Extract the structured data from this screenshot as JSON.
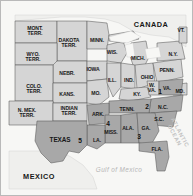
{
  "map": {
    "title": "United States Civil War Era Map",
    "colors": {
      "union": "#d5d5d5",
      "confederate": "#a8a8a8",
      "territory": "#d5d5d5",
      "water": "#f4f4f2",
      "foreign": "#efefed",
      "border": "#5a5a5a",
      "frame": "#b9b9b9",
      "label": "#171717",
      "ocean_label": "#b6b6b6"
    },
    "regions": [
      {
        "id": "mont-terr",
        "label": "MONT.\nTERR.",
        "x": 34,
        "y": 30,
        "size": "s6",
        "fill": "union"
      },
      {
        "id": "dakota-terr",
        "label": "DAKOTA\nTERR.",
        "x": 68,
        "y": 42,
        "size": "s6",
        "fill": "union"
      },
      {
        "id": "minn",
        "label": "MINN.",
        "x": 96,
        "y": 39,
        "size": "s6",
        "fill": "union"
      },
      {
        "id": "wyo-terr",
        "label": "WYO.\nTERR.",
        "x": 32,
        "y": 56,
        "size": "s6",
        "fill": "union"
      },
      {
        "id": "wis",
        "label": "WIS.",
        "x": 111,
        "y": 51,
        "size": "s6",
        "fill": "union"
      },
      {
        "id": "mich",
        "label": "MICH.",
        "x": 137,
        "y": 57,
        "size": "s6",
        "fill": "union"
      },
      {
        "id": "colo-terr",
        "label": "COLO.\nTERR.",
        "x": 33,
        "y": 88,
        "size": "s6",
        "fill": "union"
      },
      {
        "id": "nebr",
        "label": "NEBR.",
        "x": 66,
        "y": 72,
        "size": "s6",
        "fill": "union"
      },
      {
        "id": "iowa",
        "label": "IOWA",
        "x": 92,
        "y": 68,
        "size": "s6",
        "fill": "union"
      },
      {
        "id": "ill",
        "label": "ILL.",
        "x": 111,
        "y": 79,
        "size": "s6",
        "fill": "union"
      },
      {
        "id": "ind",
        "label": "IND.",
        "x": 128,
        "y": 79,
        "size": "s6",
        "fill": "union"
      },
      {
        "id": "ohio",
        "label": "OHIO",
        "x": 146,
        "y": 76,
        "size": "s6",
        "fill": "union"
      },
      {
        "id": "penn",
        "label": "PENN.",
        "x": 166,
        "y": 69,
        "size": "s6",
        "fill": "union"
      },
      {
        "id": "ny",
        "label": "N.Y.",
        "x": 172,
        "y": 53,
        "size": "s6",
        "fill": "union"
      },
      {
        "id": "vt",
        "label": "VT.",
        "x": 180,
        "y": 29,
        "size": "s6",
        "fill": "union"
      },
      {
        "id": "kans",
        "label": "KANS.",
        "x": 66,
        "y": 93,
        "size": "s6",
        "fill": "union"
      },
      {
        "id": "mo",
        "label": "MO.",
        "x": 95,
        "y": 92,
        "size": "s6",
        "fill": "union"
      },
      {
        "id": "ky",
        "label": "KY.",
        "x": 136,
        "y": 93,
        "size": "s6",
        "fill": "union"
      },
      {
        "id": "w-va",
        "label": "W.\nVA.",
        "x": 151,
        "y": 87,
        "size": "s6",
        "fill": "union"
      },
      {
        "id": "va",
        "label": "VA.",
        "x": 166,
        "y": 87,
        "size": "s6",
        "fill": "confederate"
      },
      {
        "id": "md",
        "label": "MD.",
        "x": 179,
        "y": 90,
        "size": "s6",
        "fill": "union"
      },
      {
        "id": "n-mex-terr",
        "label": "N. MEX.\nTERR.",
        "x": 26,
        "y": 112,
        "size": "s6",
        "fill": "union"
      },
      {
        "id": "indian-terr",
        "label": "INDIAN\nTERR.",
        "x": 68,
        "y": 110,
        "size": "s6",
        "fill": "union"
      },
      {
        "id": "ark",
        "label": "ARK.",
        "x": 97,
        "y": 113,
        "size": "s6",
        "fill": "confederate"
      },
      {
        "id": "tenn",
        "label": "TENN.",
        "x": 126,
        "y": 108,
        "size": "s6",
        "fill": "confederate"
      },
      {
        "id": "nc",
        "label": "N.C.",
        "x": 162,
        "y": 106,
        "size": "s6",
        "fill": "confederate"
      },
      {
        "id": "sc",
        "label": "S.C.",
        "x": 158,
        "y": 118,
        "size": "s6",
        "fill": "confederate"
      },
      {
        "id": "miss",
        "label": "MISS.",
        "x": 110,
        "y": 131,
        "size": "s6",
        "fill": "confederate"
      },
      {
        "id": "ala",
        "label": "ALA.",
        "x": 127,
        "y": 127,
        "size": "s6",
        "fill": "confederate"
      },
      {
        "id": "ga",
        "label": "GA.",
        "x": 145,
        "y": 127,
        "size": "s6",
        "fill": "confederate"
      },
      {
        "id": "la",
        "label": "LA.",
        "x": 96,
        "y": 139,
        "size": "s6",
        "fill": "confederate"
      },
      {
        "id": "texas",
        "label": "TEXAS",
        "x": 59,
        "y": 139,
        "size": "s7",
        "fill": "confederate"
      },
      {
        "id": "fla",
        "label": "FLA.",
        "x": 156,
        "y": 148,
        "size": "s6",
        "fill": "confederate"
      },
      {
        "id": "canada",
        "label": "CANADA",
        "x": 150,
        "y": 24,
        "size": "s8",
        "fill": "foreign"
      },
      {
        "id": "mexico",
        "label": "MEXICO",
        "x": 38,
        "y": 176,
        "size": "s8",
        "fill": "foreign"
      }
    ],
    "numbers": [
      {
        "id": "marker-1",
        "value": "1",
        "x": 159,
        "y": 90
      },
      {
        "id": "marker-2",
        "value": "2",
        "x": 146,
        "y": 105
      },
      {
        "id": "marker-3",
        "value": "3",
        "x": 138,
        "y": 135
      },
      {
        "id": "marker-4",
        "value": "4",
        "x": 107,
        "y": 122
      },
      {
        "id": "marker-5",
        "value": "5",
        "x": 79,
        "y": 139
      }
    ],
    "water_labels": [
      {
        "id": "gulf-of-mexico",
        "label": "Gulf of Mexico",
        "x": 118,
        "y": 168
      },
      {
        "id": "atlantic-ocean",
        "label": "ATLANTIC\nOCEAN",
        "x": 176,
        "y": 133
      }
    ]
  }
}
